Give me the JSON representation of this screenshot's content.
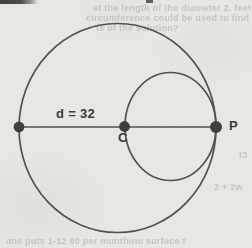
{
  "figure": {
    "background_color": "#e9e8e4",
    "stroke_color": "#4e4e4e",
    "stroke_width": 1.7,
    "dot_color": "#3c3c3c",
    "label_color": "#383838",
    "bleed_text_color": "#c6c5c1",
    "labels": {
      "diameter": "d = 32",
      "center": "C",
      "point": "P"
    },
    "geometry": {
      "large_circle": {
        "cx": 117.5,
        "cy": 128,
        "rx": 98.5,
        "ry": 104.5
      },
      "small_circle": {
        "cx": 170.5,
        "cy": 126.5,
        "rx": 45.5,
        "ry": 54
      },
      "diameter_line": {
        "x1": 19,
        "y1": 127,
        "x2": 216,
        "y2": 127
      },
      "points": [
        {
          "name": "left-endpoint-dot",
          "x": 19,
          "y": 127,
          "r": 5.4
        },
        {
          "name": "center-c-dot",
          "x": 124.5,
          "y": 126.5,
          "r": 5.4
        },
        {
          "name": "point-p-dot",
          "x": 216,
          "y": 127,
          "r": 6
        }
      ]
    },
    "top_rule": {
      "x": 0,
      "y": 0,
      "width": 38,
      "height": 4
    },
    "top_tick": {
      "x": 146,
      "y": 0,
      "width": 7,
      "height": 3
    },
    "bleedthrough_fragments": [
      {
        "text": "st the length of the diameter 2. feet",
        "x": 93,
        "y": 3
      },
      {
        "text": "circumference could be used to find the",
        "x": 86,
        "y": 13
      },
      {
        "text": "ts of the solution?",
        "x": 96,
        "y": 23
      },
      {
        "text": "t3",
        "x": 239,
        "y": 150
      },
      {
        "text": "2 + 2w",
        "x": 214,
        "y": 182
      },
      {
        "text": "ane puts 1-12 60 per munthinu surface t",
        "x": 6,
        "y": 236
      }
    ]
  }
}
